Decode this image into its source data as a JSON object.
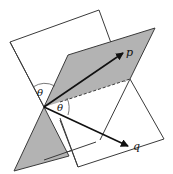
{
  "diagram": {
    "colors": {
      "background": "#ffffff",
      "plane_fill_white": "#ffffff",
      "plane_fill_gray": "#b3b3b3",
      "edge": "#3a3a3a",
      "arrow": "#111111"
    },
    "labels": {
      "vector_p": "p",
      "vector_q": "q",
      "angle_upper": "θ",
      "angle_lower": "θ"
    },
    "origin": [
      44,
      107
    ],
    "vectors": [
      {
        "name": "p",
        "tip": [
          123,
          53
        ]
      },
      {
        "name": "q",
        "tip": [
          128,
          146
        ]
      }
    ]
  }
}
